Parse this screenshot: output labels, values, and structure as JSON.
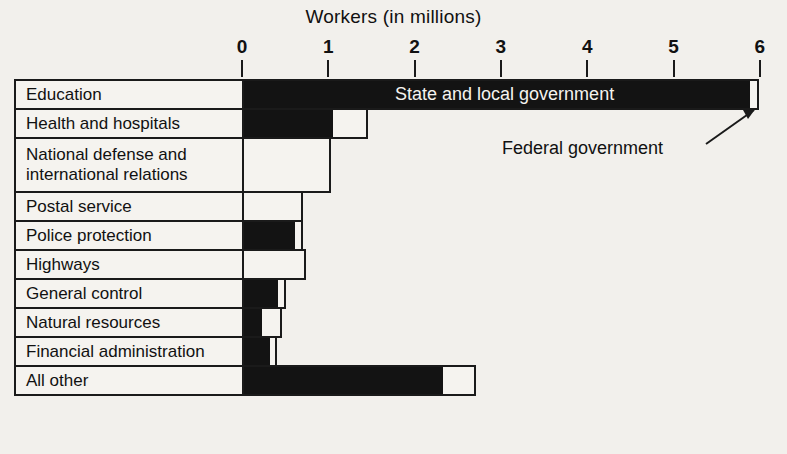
{
  "chart_data": {
    "type": "bar",
    "orientation": "horizontal",
    "stacked": true,
    "title": "Workers (in millions)",
    "xlabel": "Workers (in millions)",
    "ylabel": "",
    "xlim": [
      0,
      6
    ],
    "xticks": [
      0,
      1,
      2,
      3,
      4,
      5,
      6
    ],
    "xtick_labels": [
      "0",
      "1",
      "2",
      "3",
      "4",
      "5",
      "6"
    ],
    "grid": false,
    "legend_position": "in-plot-annotations",
    "series": [
      {
        "name": "State and local government",
        "color": "#131313",
        "values": [
          5.89,
          1.05,
          0.0,
          0.0,
          0.61,
          0.0,
          0.42,
          0.23,
          0.32,
          2.33
        ]
      },
      {
        "name": "Federal government",
        "color": "#f5f3ef",
        "values": [
          0.09,
          0.4,
          1.02,
          0.7,
          0.09,
          0.73,
          0.08,
          0.22,
          0.07,
          0.37
        ]
      }
    ],
    "categories": [
      "Education",
      "Health and hospitals",
      "National defense and international relations",
      "Postal service",
      "Police protection",
      "Highways",
      "General control",
      "Natural resources",
      "Financial administration",
      "All other"
    ],
    "totals": [
      5.98,
      1.45,
      1.02,
      0.7,
      0.7,
      0.73,
      0.5,
      0.45,
      0.39,
      2.7
    ],
    "annotations": [
      {
        "text": "State and local government",
        "kind": "series-label"
      },
      {
        "text": "Federal government",
        "kind": "callout-with-arrow"
      }
    ]
  },
  "rows": [
    {
      "label_line1": "Education",
      "label_line2": ""
    },
    {
      "label_line1": "Health and hospitals",
      "label_line2": ""
    },
    {
      "label_line1": "National defense and",
      "label_line2": "international relations"
    },
    {
      "label_line1": "Postal service",
      "label_line2": ""
    },
    {
      "label_line1": "Police protection",
      "label_line2": ""
    },
    {
      "label_line1": "Highways",
      "label_line2": ""
    },
    {
      "label_line1": "General control",
      "label_line2": ""
    },
    {
      "label_line1": "Natural resources",
      "label_line2": ""
    },
    {
      "label_line1": "Financial administration",
      "label_line2": ""
    },
    {
      "label_line1": "All other",
      "label_line2": ""
    }
  ],
  "ticks": [
    {
      "label": "0"
    },
    {
      "label": "1"
    },
    {
      "label": "2"
    },
    {
      "label": "3"
    },
    {
      "label": "4"
    },
    {
      "label": "5"
    },
    {
      "label": "6"
    }
  ],
  "labels": {
    "state_local": "State and local government",
    "federal": "Federal government"
  }
}
